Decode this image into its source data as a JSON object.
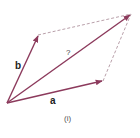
{
  "diagram": {
    "caption": "(i)",
    "colors": {
      "vector": "#8c3a5c",
      "dashed": "#b9a0aa",
      "text": "#222222"
    },
    "points": {
      "origin": [
        7,
        103
      ],
      "a_tip": [
        103,
        81
      ],
      "b_tip": [
        38,
        35
      ],
      "sum_tip": [
        131,
        14
      ]
    },
    "vectors": [
      {
        "label": "a",
        "from": "origin",
        "to": "a_tip",
        "bold": true
      },
      {
        "label": "b",
        "from": "origin",
        "to": "b_tip",
        "bold": true
      },
      {
        "label": "?",
        "from": "origin",
        "to": "sum_tip",
        "bold": false
      }
    ],
    "labels": {
      "a": "a",
      "b": "b",
      "resultant": "?",
      "caption": "(i)"
    }
  }
}
